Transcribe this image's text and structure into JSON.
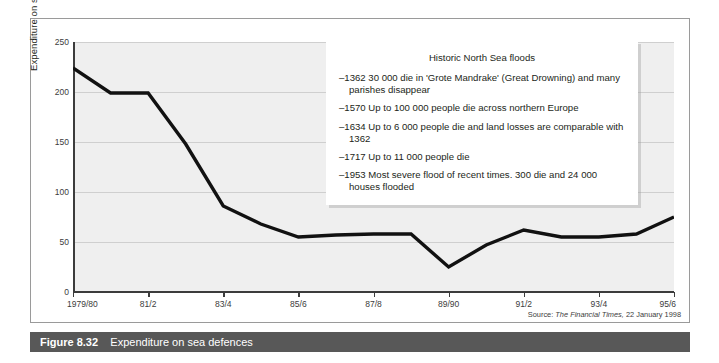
{
  "caption": {
    "figure_number": "Figure 8.32",
    "title": "Expenditure on sea defences"
  },
  "source": {
    "prefix": "Source:",
    "publication": "The Financial Times,",
    "date": "22 January 1998"
  },
  "info_box": {
    "title": "Historic North Sea floods",
    "items": [
      "–1362 30 000 die in 'Grote Mandrake' (Great Drowning) and many parishes disappear",
      "–1570 Up to 100 000 people die across northern Europe",
      "–1634 Up to 6 000 people die and land losses are comparable with 1362",
      "–1717 Up to 11 000 people die",
      "–1953 Most severe flood of recent times. 300 die and 24 000 houses flooded"
    ]
  },
  "chart_data": {
    "type": "line",
    "title": "Expenditure on sea defences",
    "xlabel": "",
    "ylabel": "Expenditure on sea defences (£m)",
    "ylim": [
      0,
      250
    ],
    "yticks": [
      0,
      50,
      100,
      150,
      200,
      250
    ],
    "grid": true,
    "legend": "none",
    "line_color": "#111111",
    "plot_background": "#efefef",
    "categories": [
      "1979/80",
      "80/1",
      "81/2",
      "82/3",
      "83/4",
      "84/5",
      "85/6",
      "86/7",
      "87/8",
      "88/9",
      "89/90",
      "90/1",
      "91/2",
      "92/3",
      "93/4",
      "94/5",
      "95/6"
    ],
    "xtick_labels": [
      "1979/80",
      "81/2",
      "83/4",
      "85/6",
      "87/8",
      "89/90",
      "91/2",
      "93/4",
      "95/6"
    ],
    "values": [
      224,
      199,
      199,
      148,
      86,
      68,
      55,
      57,
      58,
      58,
      25,
      47,
      62,
      55,
      55,
      58,
      75
    ],
    "units": "£m"
  }
}
